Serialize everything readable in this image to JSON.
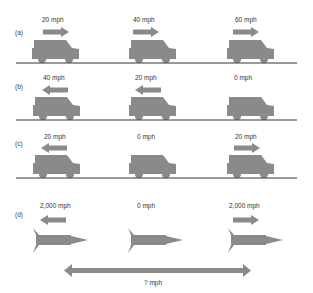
{
  "colors": {
    "shape_fill": "#8a8a8a",
    "ground_line": "#333333",
    "text": "#333333"
  },
  "rows": [
    {
      "id": "a",
      "label": "(a)",
      "items": [
        {
          "object": "car",
          "speed": "20 mph",
          "direction": "right"
        },
        {
          "object": "car",
          "speed": "40 mph",
          "direction": "right"
        },
        {
          "object": "car",
          "speed": "60 mph",
          "direction": "right"
        }
      ]
    },
    {
      "id": "b",
      "label": "(b)",
      "items": [
        {
          "object": "car",
          "speed": "40 mph",
          "direction": "left"
        },
        {
          "object": "car",
          "speed": "20 mph",
          "direction": "left"
        },
        {
          "object": "car",
          "speed": "0 mph",
          "direction": "none"
        }
      ]
    },
    {
      "id": "c",
      "label": "(c)",
      "items": [
        {
          "object": "car",
          "speed": "20 mph",
          "direction": "left"
        },
        {
          "object": "car",
          "speed": "0 mph",
          "direction": "none"
        },
        {
          "object": "car",
          "speed": "20 mph",
          "direction": "right"
        }
      ]
    },
    {
      "id": "d",
      "label": "(d)",
      "items": [
        {
          "object": "rocket",
          "speed": "2,000 mph",
          "direction": "left"
        },
        {
          "object": "rocket",
          "speed": "0 mph",
          "direction": "none"
        },
        {
          "object": "rocket",
          "speed": "2,000 mph",
          "direction": "right"
        }
      ]
    }
  ],
  "bottom_arrow": {
    "label": "? mph",
    "direction": "both"
  }
}
